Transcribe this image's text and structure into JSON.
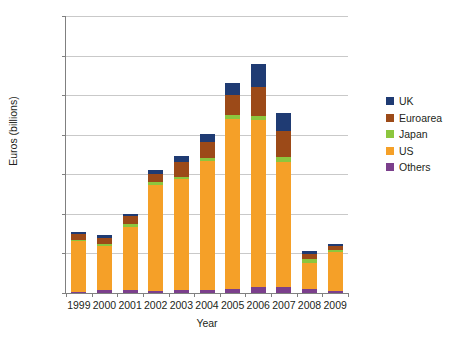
{
  "chart_data": {
    "type": "bar",
    "stacked": true,
    "title": "",
    "xlabel": "Year",
    "ylabel": "Euros (billions)",
    "categories": [
      "1999",
      "2000",
      "2001",
      "2002",
      "2003",
      "2004",
      "2005",
      "2006",
      "2007",
      "2008",
      "2009"
    ],
    "ylim": [
      0,
      3500
    ],
    "yticks": [
      0,
      500,
      1000,
      1500,
      2000,
      2500,
      3000,
      3500
    ],
    "ytick_labels": [
      "0",
      "500",
      "1000",
      "1500",
      "2000",
      "2500",
      "3000",
      "3500"
    ],
    "grid": true,
    "legend_position": "right",
    "series": [
      {
        "name": "Others",
        "color": "#7B3F8C",
        "values": [
          10,
          35,
          35,
          20,
          35,
          40,
          55,
          70,
          80,
          45,
          30
        ]
      },
      {
        "name": "US",
        "color": "#F5A028",
        "values": [
          645,
          560,
          805,
          1340,
          1410,
          1625,
          2140,
          2110,
          1580,
          330,
          485
        ]
      },
      {
        "name": "Japan",
        "color": "#8CC63E",
        "values": [
          15,
          20,
          35,
          45,
          25,
          45,
          60,
          60,
          55,
          55,
          25
        ]
      },
      {
        "name": "Euroarea",
        "color": "#9C4A18",
        "values": [
          75,
          80,
          95,
          100,
          180,
          200,
          250,
          360,
          330,
          65,
          55
        ]
      },
      {
        "name": "UK",
        "color": "#1F3B73",
        "values": [
          25,
          35,
          25,
          55,
          80,
          105,
          145,
          290,
          225,
          40,
          20
        ]
      }
    ],
    "totals": [
      770,
      730,
      995,
      1560,
      1730,
      2015,
      2650,
      2890,
      2270,
      535,
      615
    ]
  },
  "legend": {
    "items": [
      {
        "label": "UK",
        "color": "#1F3B73"
      },
      {
        "label": "Euroarea",
        "color": "#9C4A18"
      },
      {
        "label": "Japan",
        "color": "#8CC63E"
      },
      {
        "label": "US",
        "color": "#F5A028"
      },
      {
        "label": "Others",
        "color": "#7B3F8C"
      }
    ]
  }
}
